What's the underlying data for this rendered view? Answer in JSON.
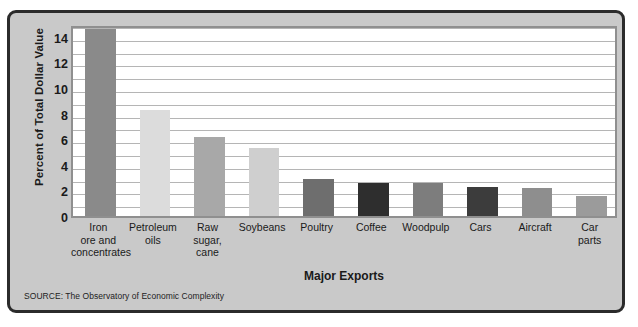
{
  "chart_data": {
    "type": "bar",
    "title": "",
    "xlabel": "Major Exports",
    "ylabel": "Percent of Total Dollar Value",
    "ylim": [
      0,
      15
    ],
    "yticks": [
      0,
      2,
      4,
      6,
      8,
      10,
      12,
      14
    ],
    "grid": true,
    "gridline_step": 1,
    "legend": "none",
    "categories": [
      "Iron\nore and\nconcentrates",
      "Petroleum\noils",
      "Raw\nsugar,\ncane",
      "Soybeans",
      "Poultry",
      "Coffee",
      "Woodpulp",
      "Cars",
      "Aircraft",
      "Car\nparts"
    ],
    "category_lines": [
      [
        "Iron",
        "ore and",
        "concentrates"
      ],
      [
        "Petroleum",
        "oils"
      ],
      [
        "Raw",
        "sugar,",
        "cane"
      ],
      [
        "Soybeans"
      ],
      [
        "Poultry"
      ],
      [
        "Coffee"
      ],
      [
        "Woodpulp"
      ],
      [
        "Cars"
      ],
      [
        "Aircraft"
      ],
      [
        "Car",
        "parts"
      ]
    ],
    "values": [
      14.6,
      8.3,
      6.2,
      5.3,
      2.9,
      2.6,
      2.55,
      2.25,
      2.15,
      1.6
    ],
    "bar_colors": [
      "#8a8a8a",
      "#dcdcdc",
      "#a8a8a8",
      "#cfcfcf",
      "#6e6e6e",
      "#2e2e2e",
      "#7d7d7d",
      "#3c3c3c",
      "#8e8e8e",
      "#9b9b9b"
    ]
  },
  "figure": {
    "source_note": "SOURCE: The Observatory of Economic Complexity",
    "frame_background": "#c9c9c9",
    "frame_border": "#2b2b2b",
    "plot_background": "#ffffff",
    "gridline_color": "#b5b5b5",
    "plot_border": "#8f8f8f"
  }
}
